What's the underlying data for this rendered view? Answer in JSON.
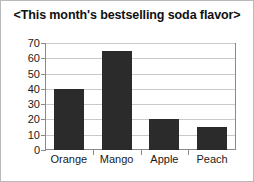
{
  "chart_data": {
    "type": "bar",
    "title": "<This month's bestselling soda flavor>",
    "categories": [
      "Orange",
      "Mango",
      "Apple",
      "Peach"
    ],
    "values": [
      40,
      65,
      20,
      15
    ],
    "xlabel": "",
    "ylabel": "",
    "ylim": [
      0,
      70
    ],
    "ytick_step": 10,
    "yticks": [
      0,
      10,
      20,
      30,
      40,
      50,
      60,
      70
    ],
    "ytick_labels": [
      "0",
      "10",
      "20",
      "30",
      "40",
      "50",
      "60",
      "70"
    ],
    "grid": true,
    "legend": false,
    "legend_position": "none",
    "colors": {
      "bar": "#2b2b2b",
      "gridline": "#c9c9c9",
      "axis": "#8a8a8a",
      "background": "#ffffff",
      "text": "#1a1a1a",
      "title": "#101010",
      "outer_border": "#b9b9b9"
    }
  }
}
